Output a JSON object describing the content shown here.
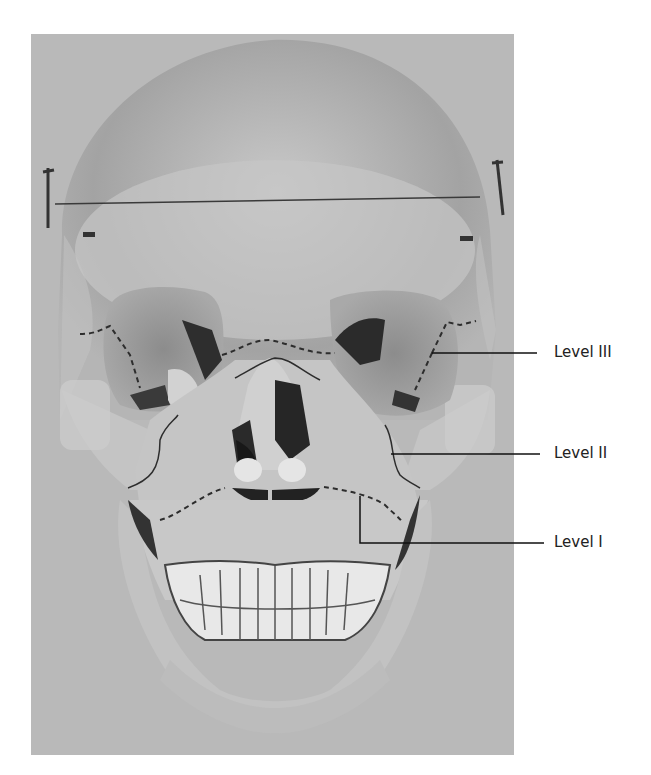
{
  "figure": {
    "background_color": "#b9b9b9",
    "labels": [
      {
        "text": "Level III",
        "x": 554,
        "y": 345
      },
      {
        "text": "Level II",
        "x": 554,
        "y": 446
      },
      {
        "text": "Level I",
        "x": 554,
        "y": 535
      }
    ]
  }
}
